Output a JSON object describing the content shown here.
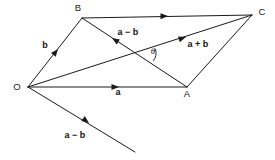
{
  "figure": {
    "type": "vector-parallelogram-diagram",
    "background_color": "#ffffff",
    "line_color": "#1a1a1a",
    "width": 275,
    "height": 160
  },
  "vertices": [
    {
      "id": "O",
      "label": "O",
      "x": 28,
      "y": 87,
      "label_x": 17,
      "label_y": 90
    },
    {
      "id": "B",
      "label": "B",
      "x": 82,
      "y": 18,
      "label_x": 78,
      "label_y": 11
    },
    {
      "id": "C",
      "label": "C",
      "x": 252,
      "y": 15,
      "label_x": 262,
      "label_y": 15
    },
    {
      "id": "A",
      "label": "A",
      "x": 187,
      "y": 87,
      "label_x": 187,
      "label_y": 97
    }
  ],
  "edges": [
    {
      "name": "edge-O-B",
      "from": "O",
      "to": "B"
    },
    {
      "name": "edge-B-C",
      "from": "B",
      "to": "C"
    },
    {
      "name": "edge-O-A",
      "from": "O",
      "to": "A"
    },
    {
      "name": "edge-A-C",
      "from": "A",
      "to": "C"
    },
    {
      "name": "edge-O-C-diagonal",
      "from": "O",
      "to": "C"
    },
    {
      "name": "edge-B-A-diagonal",
      "from": "B",
      "to": "A"
    },
    {
      "name": "edge-O-external",
      "from": "O",
      "to": "external-tip"
    }
  ],
  "external_tip": {
    "x": 135,
    "y": 152
  },
  "vector_labels": [
    {
      "id": "b",
      "text": "b",
      "x": 45,
      "y": 48
    },
    {
      "id": "a-minus-b-top",
      "text": "a − b",
      "x": 128,
      "y": 35
    },
    {
      "id": "a-plus-b",
      "text": "a + b",
      "x": 198,
      "y": 47
    },
    {
      "id": "a",
      "text": "a",
      "x": 118,
      "y": 95
    },
    {
      "id": "a-minus-b-bottom",
      "text": "a − b",
      "x": 75,
      "y": 138
    }
  ],
  "angle": {
    "symbol": "θ",
    "label_x": 153,
    "label_y": 54,
    "vertex_x": 143,
    "vertex_y": 53
  },
  "arrowheads": [
    {
      "id": "arrow-b",
      "on_edge": "edge-O-B",
      "x": 58,
      "y": 49,
      "angle": -52
    },
    {
      "id": "arrow-a",
      "on_edge": "edge-O-A",
      "x": 119,
      "y": 87,
      "angle": 0
    },
    {
      "id": "arrow-a-plus-b",
      "on_edge": "edge-O-C-diagonal",
      "x": 186,
      "y": 37,
      "angle": -18
    },
    {
      "id": "arrow-a-minus-b-top",
      "on_edge": "edge-B-A-diagonal",
      "x": 112,
      "y": 38,
      "angle": 213
    },
    {
      "id": "arrow-b-to-c",
      "on_edge": "edge-B-C",
      "x": 168,
      "y": 16,
      "angle": -1
    },
    {
      "id": "arrow-a-minus-b-bottom",
      "on_edge": "edge-O-external",
      "x": 89,
      "y": 123,
      "angle": 37
    }
  ]
}
